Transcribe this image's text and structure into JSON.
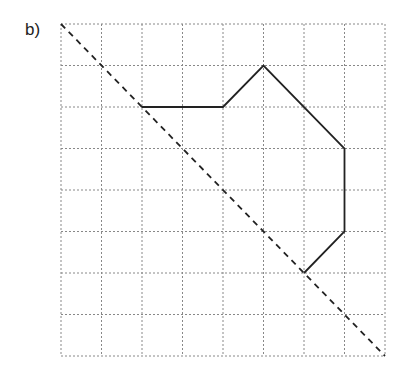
{
  "label": "b)",
  "grid": {
    "cols": 8,
    "rows": 8,
    "x0": 61,
    "y0": 24,
    "x1": 385,
    "y1": 356,
    "line_color": "#888888"
  },
  "mirror_line": {
    "from": [
      0,
      0
    ],
    "to": [
      8,
      8
    ],
    "style": "dashed",
    "color": "#222222"
  },
  "shape": {
    "color": "#222222",
    "points": [
      [
        2,
        2
      ],
      [
        4,
        2
      ],
      [
        5,
        1
      ],
      [
        7,
        3
      ],
      [
        7,
        5
      ],
      [
        6,
        6
      ]
    ]
  }
}
